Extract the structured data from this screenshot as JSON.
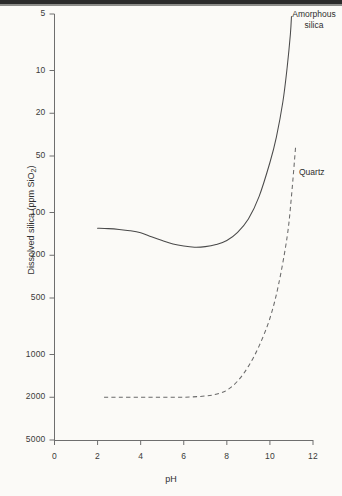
{
  "figure": {
    "background_color": "#fbfaf7",
    "ink_color": "#4a4a4a"
  },
  "axes": {
    "x_label": "pH",
    "y_label_main": "Dissolved silica (ppm SiO",
    "y_label_sub": "2",
    "y_label_tail": ")",
    "x_ticks": [
      "0",
      "2",
      "4",
      "6",
      "8",
      "10",
      "12"
    ],
    "y_ticks": [
      "5000",
      "2000",
      "1000",
      "500",
      "200",
      "100",
      "50",
      "20",
      "10",
      "5"
    ]
  },
  "annotations": {
    "amorphous": "Amorphous\nsilica",
    "quartz": "Quartz"
  },
  "chart_data": {
    "type": "line",
    "title": "",
    "xlabel": "pH",
    "ylabel": "Dissolved silica (ppm SiO2)",
    "xlim": [
      0,
      12
    ],
    "ylim": [
      5,
      5000
    ],
    "yscale": "log",
    "xscale": "linear",
    "grid": false,
    "legend": "inline-annotations",
    "x_ticks": [
      0,
      2,
      4,
      6,
      8,
      10,
      12
    ],
    "y_ticks": [
      5,
      10,
      20,
      50,
      100,
      200,
      500,
      1000,
      2000,
      5000
    ],
    "series": [
      {
        "name": "Amorphous silica",
        "style": "solid",
        "color": "#4a4a4a",
        "x": [
          2.0,
          2.5,
          3.0,
          3.5,
          4.0,
          4.5,
          5.0,
          5.5,
          6.0,
          6.5,
          7.0,
          7.5,
          8.0,
          8.5,
          9.0,
          9.5,
          10.0,
          10.3,
          10.6,
          10.8,
          10.95,
          11.0
        ],
        "y": [
          155,
          154,
          152,
          149,
          144,
          135,
          127,
          120,
          116,
          114,
          115,
          119,
          127,
          145,
          180,
          260,
          450,
          680,
          1200,
          2100,
          3600,
          4800
        ]
      },
      {
        "name": "Quartz",
        "style": "dashed",
        "color": "#6a6a6a",
        "x": [
          2.3,
          3.0,
          4.0,
          5.0,
          6.0,
          7.0,
          7.5,
          8.0,
          8.5,
          9.0,
          9.5,
          10.0,
          10.4,
          10.8,
          11.0,
          11.2
        ],
        "y": [
          10.0,
          10.0,
          10.0,
          10.0,
          10.0,
          10.2,
          10.5,
          11.2,
          13.0,
          16.5,
          23,
          36,
          62,
          135,
          260,
          600
        ]
      }
    ]
  }
}
